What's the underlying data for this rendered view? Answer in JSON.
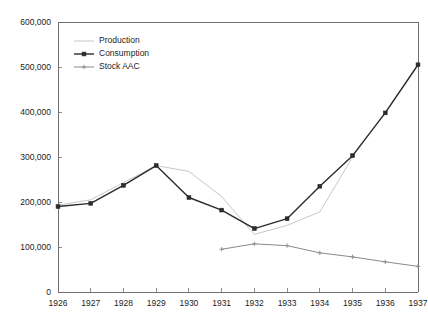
{
  "chart_data": {
    "type": "line",
    "title": "",
    "subtitle": "",
    "xlabel": "",
    "ylabel": "",
    "categories": [
      "1926",
      "1927",
      "1928",
      "1929",
      "1930",
      "1931",
      "1932",
      "1933",
      "1934",
      "1935",
      "1936",
      "1937"
    ],
    "x": [
      1926,
      1927,
      1928,
      1929,
      1930,
      1931,
      1932,
      1933,
      1934,
      1935,
      1936,
      1937
    ],
    "ylim": [
      0,
      600000
    ],
    "xlim": [
      1926,
      1937
    ],
    "y_ticks": [
      0,
      100000,
      200000,
      300000,
      400000,
      500000,
      600000
    ],
    "y_tick_labels": [
      "0",
      "100,000",
      "200,000",
      "300,000",
      "400,000",
      "500,000",
      "600,000"
    ],
    "x_tick_labels": [
      "1926",
      "1927",
      "1928",
      "1929",
      "1930",
      "1931",
      "1932",
      "1933",
      "1934",
      "1935",
      "1936",
      "1937"
    ],
    "grid": false,
    "legend_position": "top-left",
    "series": [
      {
        "name": "Production",
        "color": "#c8c8c8",
        "marker": "none",
        "x": [
          1926,
          1927,
          1928,
          1929,
          1930,
          1931,
          1932,
          1933,
          1934,
          1935,
          1936,
          1937
        ],
        "values": [
          193000,
          205000,
          243000,
          281000,
          268000,
          212000,
          128000,
          148000,
          178000,
          300000,
          400000,
          505000
        ]
      },
      {
        "name": "Consumption",
        "color": "#2b2b2b",
        "marker": "square",
        "x": [
          1926,
          1927,
          1928,
          1929,
          1930,
          1931,
          1932,
          1933,
          1934,
          1935,
          1936,
          1937
        ],
        "values": [
          190000,
          197000,
          237000,
          281000,
          210000,
          182000,
          141000,
          163000,
          235000,
          303000,
          398000,
          505000
        ]
      },
      {
        "name": "Stock AAC",
        "color": "#8a8a8a",
        "marker": "plus",
        "x": [
          1931,
          1932,
          1933,
          1934,
          1935,
          1936,
          1937
        ],
        "values": [
          95000,
          107000,
          103000,
          87000,
          78000,
          67000,
          57000
        ]
      }
    ]
  },
  "legend": {
    "entries": [
      {
        "label": "Production"
      },
      {
        "label": "Consumption"
      },
      {
        "label": "Stock AAC"
      }
    ]
  }
}
